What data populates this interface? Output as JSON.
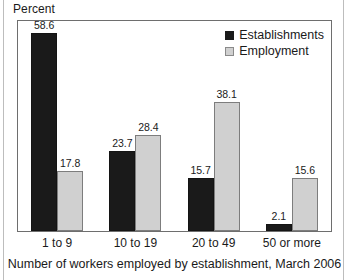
{
  "chart_data": {
    "type": "bar",
    "title": "",
    "subtitle": "",
    "xlabel": "Number of workers employed by establishment, March 2006",
    "ylabel": "Percent",
    "categories": [
      "1 to 9",
      "10 to 19",
      "20 to 49",
      "50 or more"
    ],
    "series": [
      {
        "name": "Establishments",
        "color": "#1a1a1a",
        "values": [
          58.6,
          23.7,
          15.7,
          2.1
        ],
        "value_labels": [
          "58.6",
          "23.7",
          "15.7",
          "2.1"
        ]
      },
      {
        "name": "Employment",
        "color": "#d0d0d0",
        "values": [
          17.8,
          28.4,
          38.1,
          15.6
        ],
        "value_labels": [
          "17.8",
          "28.4",
          "38.1",
          "15.6"
        ]
      }
    ],
    "ylim": [
      0,
      62
    ],
    "grid": false,
    "legend_position": "top-right",
    "value_labels_shown": true,
    "axis_tick_labels_y": []
  },
  "legend": {
    "items": [
      {
        "label": "Establishments",
        "swatch": "series-dark"
      },
      {
        "label": "Employment",
        "swatch": "series-light"
      }
    ]
  }
}
